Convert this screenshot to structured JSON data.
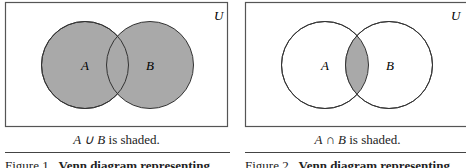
{
  "figures": [
    {
      "universe_label": "U",
      "set_a_label": "A",
      "set_b_label": "B",
      "shaded_region": "union",
      "caption_expr": "A ∪ B",
      "caption_text": " is shaded.",
      "figure_number": "Figure 1",
      "figure_title": "Venn diagram representing"
    },
    {
      "universe_label": "U",
      "set_a_label": "A",
      "set_b_label": "B",
      "shaded_region": "intersection",
      "caption_expr": "A ∩ B",
      "caption_text": " is shaded.",
      "figure_number": "Figure 2",
      "figure_title": "Venn diagram representing"
    }
  ],
  "colors": {
    "shade": "#a9a9a9",
    "stroke": "#333333",
    "background": "#ffffff"
  }
}
